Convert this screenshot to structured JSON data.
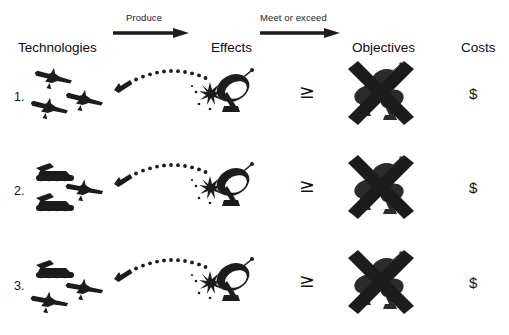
{
  "diagram": {
    "title_columns": {
      "technologies": "Technologies",
      "effects": "Effects",
      "objectives": "Objectives",
      "costs": "Costs"
    },
    "arrows": [
      {
        "name": "produce-arrow",
        "label": "Produce"
      },
      {
        "name": "meet-or-exceed-arrow",
        "label": "Meet or exceed"
      }
    ],
    "comparator_symbol": "≥",
    "cost_symbol": "$",
    "colors": {
      "ink": "#1c1c1c",
      "background": "#ffffff",
      "text": "#111111"
    },
    "rows": [
      {
        "number": "1.",
        "technologies_icons": [
          "jet-aircraft-icon",
          "jet-aircraft-icon",
          "jet-aircraft-icon"
        ],
        "effects_icons": [
          "missile-icon",
          "dotted-trajectory-icon",
          "explosion-icon",
          "radar-dish-icon"
        ],
        "comparator": "≥",
        "objectives_icon": "crossed-out-radar-cluster-icon",
        "cost": "$"
      },
      {
        "number": "2.",
        "technologies_icons": [
          "tracked-vehicle-icon",
          "tracked-vehicle-icon",
          "jet-aircraft-icon"
        ],
        "effects_icons": [
          "missile-icon",
          "dotted-trajectory-icon",
          "explosion-icon",
          "radar-dish-icon"
        ],
        "comparator": "≥",
        "objectives_icon": "crossed-out-radar-cluster-icon",
        "cost": "$"
      },
      {
        "number": "3.",
        "technologies_icons": [
          "tracked-vehicle-icon",
          "jet-aircraft-icon",
          "jet-aircraft-icon"
        ],
        "effects_icons": [
          "missile-icon",
          "dotted-trajectory-icon",
          "explosion-icon",
          "radar-dish-icon"
        ],
        "comparator": "≥",
        "objectives_icon": "crossed-out-radar-cluster-icon",
        "cost": "$"
      }
    ]
  }
}
